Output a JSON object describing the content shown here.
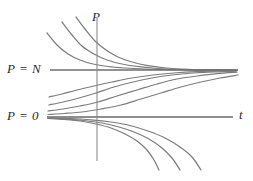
{
  "figure": {
    "title": ""
  },
  "labels": {
    "p_axis": "P",
    "t_axis": "t",
    "equilibrium_n": "P = N",
    "equilibrium_zero": "P = 0"
  },
  "colors": {
    "curve": "#7d7d7d",
    "equilibrium": "#6e6e6e",
    "axis": "#8a8a8a",
    "text": "#2b2b2b",
    "background": "#ffffff"
  },
  "chart_data": {
    "type": "line",
    "title": "",
    "xlabel": "t",
    "ylabel": "P",
    "grid": false,
    "legend": "none",
    "xlim": [
      0,
      253
    ],
    "ylim": [
      181,
      0
    ],
    "annotations": [
      {
        "text": "P",
        "x": 97,
        "y": 16,
        "role": "vertical-axis-label"
      },
      {
        "text": "t",
        "x": 241,
        "y": 114,
        "role": "horizontal-axis-label"
      },
      {
        "text": "P = N",
        "x": 28,
        "y": 69,
        "role": "equilibrium-label"
      },
      {
        "text": "P = 0",
        "x": 26,
        "y": 116,
        "role": "equilibrium-label"
      }
    ],
    "axes": [
      {
        "name": "p-axis",
        "x1": 97,
        "y1": 18,
        "x2": 97,
        "y2": 161
      },
      {
        "name": "t-axis",
        "x1": 47,
        "y1": 117,
        "x2": 233,
        "y2": 117
      }
    ],
    "equilibria": [
      {
        "name": "P = N",
        "value": "N",
        "x1": 50,
        "y1": 70,
        "x2": 238,
        "y2": 70
      },
      {
        "name": "P = 0",
        "value": "0",
        "x1": 47,
        "y1": 117,
        "x2": 233,
        "y2": 117
      }
    ],
    "series": [
      {
        "name": "above-N-curve-1",
        "region": "above-N",
        "points": "47,33 57,45 68,54 80,60 93,64 108,66.5 125,68 145,69 170,69.6 200,70 236,70.2"
      },
      {
        "name": "above-N-curve-2",
        "region": "above-N",
        "points": "62,22 72,35 82,46 94,54 107,60 122,64 139,66.7 158,68.5 182,69.5 208,70 236,70.3"
      },
      {
        "name": "above-N-curve-3",
        "region": "above-N",
        "points": "76,17 85,29 95,41 106,50 118,57 132,62 148,65.6 166,68 188,69.3 212,70 237,70.4"
      },
      {
        "name": "below-N-curve-1",
        "region": "between-0-and-N",
        "points": "49,97 62,94 77,90 94,86 112,82 132,78 153,75 174,73 196,71.6 216,71 236,70.6"
      },
      {
        "name": "below-N-curve-2",
        "region": "between-0-and-N",
        "points": "49,105 63,102 79,98 96,93 114,87 133,82 152,78 172,75 193,73 214,71.8 236,71.2"
      },
      {
        "name": "below-N-curve-3",
        "region": "between-0-and-N",
        "points": "48,111 63,109 80,106 98,102 117,96 137,90 157,84 177,79 197,76 217,73.6 237,72.2"
      },
      {
        "name": "below-N-curve-4",
        "region": "between-0-and-N",
        "points": "48,114.5 64,113.5 82,112 101,109 121,105 141,99 161,93 181,87 201,82 220,78 238,75"
      },
      {
        "name": "below-zero-curve-1",
        "region": "below-0",
        "points": "48,118.5 64,119.5 80,121 96,124 111,128 125,134 137,141 147,150 154,160 159,170"
      },
      {
        "name": "below-zero-curve-2",
        "region": "below-0",
        "points": "48,118 66,119 84,120.5 102,123 119,127 134,132 149,139 162,148 172,158 180,170"
      },
      {
        "name": "below-zero-curve-3",
        "region": "below-0",
        "points": "48,117.8 70,118.5 91,119.8 111,122 130,125.5 148,131 165,138 180,147 192,157 201,170"
      }
    ]
  }
}
